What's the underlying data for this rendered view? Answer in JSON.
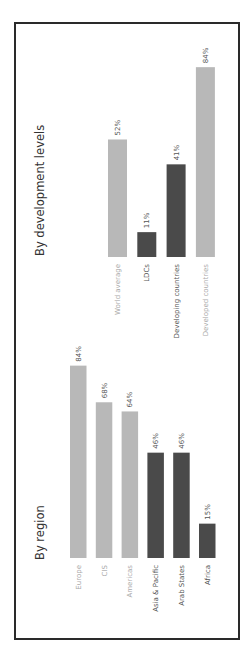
{
  "chart_data": [
    {
      "type": "bar",
      "title": "By development levels",
      "orientation": "rotated-90-ccw",
      "categories": [
        "World average",
        "LDCs",
        "Developing countries",
        "Developed countries"
      ],
      "values": [
        52,
        11,
        41,
        84
      ],
      "value_labels": [
        "52%",
        "11%",
        "41%",
        "84%"
      ],
      "bar_colors": [
        "#b8b8b8",
        "#4a4a4a",
        "#4a4a4a",
        "#b8b8b8"
      ],
      "label_colors": [
        "#aaaaaa",
        "#555555",
        "#555555",
        "#aaaaaa"
      ],
      "ylim": [
        0,
        100
      ],
      "xlabel": "",
      "ylabel": "",
      "grid": false,
      "legend": "none"
    },
    {
      "type": "bar",
      "title": "By region",
      "orientation": "rotated-90-ccw",
      "categories": [
        "Europe",
        "CIS",
        "Americas",
        "Asia & Pacific",
        "Arab States",
        "Africa"
      ],
      "values": [
        84,
        68,
        64,
        46,
        46,
        15
      ],
      "value_labels": [
        "84%",
        "68%",
        "64%",
        "46%",
        "46%",
        "15%"
      ],
      "bar_colors": [
        "#b8b8b8",
        "#b8b8b8",
        "#b8b8b8",
        "#4a4a4a",
        "#4a4a4a",
        "#4a4a4a"
      ],
      "label_colors": [
        "#aaaaaa",
        "#aaaaaa",
        "#aaaaaa",
        "#555555",
        "#555555",
        "#555555"
      ],
      "ylim": [
        0,
        100
      ],
      "xlabel": "",
      "ylabel": "",
      "grid": false,
      "legend": "none"
    }
  ]
}
